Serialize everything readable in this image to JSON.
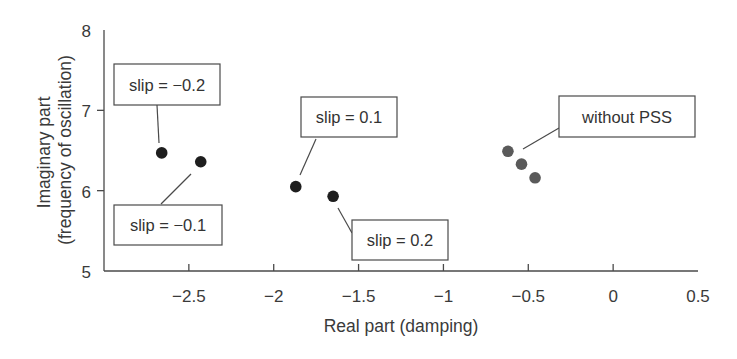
{
  "chart_data": {
    "type": "scatter",
    "title": "",
    "xlabel": "Real part (damping)",
    "ylabel": [
      "Imaginary part",
      "(frequency of oscillation)"
    ],
    "xlim": [
      -3.0,
      0.5
    ],
    "ylim": [
      5,
      8
    ],
    "xticks": [
      -2.5,
      -2,
      -1.5,
      -1,
      -0.5,
      0,
      0.5
    ],
    "xtick_labels": [
      "−2.5",
      "−2",
      "−1.5",
      "−1",
      "−0.5",
      "0",
      "0.5"
    ],
    "yticks": [
      5,
      6,
      7,
      8
    ],
    "ytick_labels": [
      "5",
      "6",
      "7",
      "8"
    ],
    "grid": false,
    "legend": null,
    "series": [
      {
        "name": "with PSS",
        "color": "#1e1e1e",
        "points": [
          {
            "label": "slip = −0.2",
            "x": -2.66,
            "y": 6.47
          },
          {
            "label": "slip = −0.1",
            "x": -2.43,
            "y": 6.36
          },
          {
            "label": "slip = 0.1",
            "x": -1.87,
            "y": 6.05
          },
          {
            "label": "slip = 0.2",
            "x": -1.65,
            "y": 5.93
          }
        ]
      },
      {
        "name": "without PSS",
        "color": "#5a5a5a",
        "points": [
          {
            "x": -0.62,
            "y": 6.49
          },
          {
            "x": -0.54,
            "y": 6.33
          },
          {
            "x": -0.46,
            "y": 6.16
          }
        ]
      }
    ],
    "annotations": [
      {
        "text": "slip = −0.2",
        "box": [
          114,
          64,
          106,
          41
        ],
        "line": [
          [
            157,
            105
          ],
          [
            159,
            143
          ]
        ]
      },
      {
        "text": "slip = −0.1",
        "box": [
          114,
          205,
          108,
          40
        ],
        "line": [
          [
            161,
            204
          ],
          [
            191,
            174
          ]
        ]
      },
      {
        "text": "slip = 0.1",
        "box": [
          301,
          97,
          96,
          40
        ],
        "line": [
          [
            316,
            139
          ],
          [
            300,
            175
          ]
        ]
      },
      {
        "text": "slip = 0.2",
        "box": [
          352,
          220,
          96,
          40
        ],
        "line": [
          [
            352,
            233
          ],
          [
            338,
            208
          ]
        ]
      },
      {
        "text": "without PSS",
        "box": [
          559,
          96,
          136,
          41
        ],
        "line": [
          [
            559,
            128
          ],
          [
            523,
            149
          ]
        ]
      }
    ]
  }
}
